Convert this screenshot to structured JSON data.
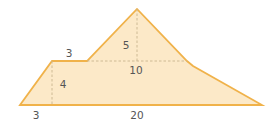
{
  "diagram": {
    "type": "composite-area-figure",
    "colors": {
      "fill": "#fce9c8",
      "stroke": "#f0b24a",
      "dashed": "#c9b48e",
      "label": "#555555"
    },
    "shape_points": "20,105 52,61 87,61 137,9 187,61 193,66 262,105",
    "dashed_lines": [
      {
        "name": "trapezoid-height-line",
        "x1": 52,
        "y1": 61,
        "x2": 52,
        "y2": 105
      },
      {
        "name": "triangle-height-line",
        "x1": 137,
        "y1": 9,
        "x2": 137,
        "y2": 61
      },
      {
        "name": "triangle-base-line",
        "x1": 87,
        "y1": 61,
        "x2": 187,
        "y2": 61
      }
    ],
    "labels": {
      "top_left_width": "3",
      "triangle_height": "5",
      "triangle_base": "10",
      "trapezoid_height": "4",
      "bottom_left_offset": "3",
      "bottom_base": "20"
    }
  }
}
